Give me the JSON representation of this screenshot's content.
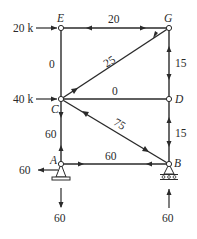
{
  "diagram": {
    "type": "truss-free-body",
    "joints": {
      "E": {
        "label": "E",
        "x": 61,
        "y": 28
      },
      "G": {
        "label": "G",
        "x": 169,
        "y": 28
      },
      "C": {
        "label": "C",
        "x": 61,
        "y": 99
      },
      "D": {
        "label": "D",
        "x": 169,
        "y": 99
      },
      "A": {
        "label": "A",
        "x": 61,
        "y": 164
      },
      "B": {
        "label": "B",
        "x": 169,
        "y": 164
      }
    },
    "members": [
      {
        "id": "EG",
        "force": "20"
      },
      {
        "id": "EC",
        "force": "0"
      },
      {
        "id": "CG",
        "force": "25"
      },
      {
        "id": "CD",
        "force": "0"
      },
      {
        "id": "GD",
        "force": "15"
      },
      {
        "id": "DB",
        "force": "15"
      },
      {
        "id": "CA",
        "force": "60"
      },
      {
        "id": "CB",
        "force": "75"
      },
      {
        "id": "AB",
        "force": "60"
      }
    ],
    "loads": {
      "E": "20 k",
      "C": "40 k"
    },
    "reactions": {
      "A_horizontal": "60",
      "A_vertical": "60",
      "B_vertical": "60"
    }
  }
}
